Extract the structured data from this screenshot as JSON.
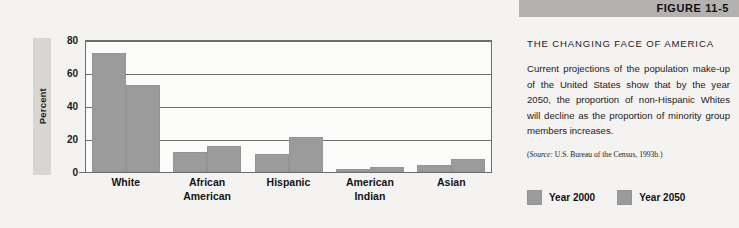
{
  "figure": {
    "number_label": "FIGURE 11-5",
    "title": "THE CHANGING FACE OF AMERICA",
    "body": "Current projections of the population make-up of the United States show that by the year 2050, the proportion of non-Hispanic Whites will decline as the proportion of minority group members increases.",
    "source_prefix": "(",
    "source_word": "Source:",
    "source_rest": " U.S. Bureau of the Census, 1993b.)"
  },
  "legend": {
    "items": [
      {
        "label": "Year 2000",
        "color": "#9b9b9b"
      },
      {
        "label": "Year 2050",
        "color": "#9b9b9b"
      }
    ]
  },
  "chart_data": {
    "type": "bar",
    "title": "THE CHANGING FACE OF AMERICA",
    "xlabel": "",
    "ylabel": "Percent",
    "ylim": [
      0,
      80
    ],
    "yticks": [
      0,
      20,
      40,
      60,
      80
    ],
    "ytick_labels": [
      "0",
      "20",
      "40",
      "60",
      "80"
    ],
    "grid": true,
    "legend_position": "bottom-right",
    "categories": [
      "White",
      "African American",
      "Hispanic",
      "American Indian",
      "Asian"
    ],
    "category_lines": [
      [
        "White"
      ],
      [
        "African",
        "American"
      ],
      [
        "Hispanic"
      ],
      [
        "American",
        "Indian"
      ],
      [
        "Asian"
      ]
    ],
    "series": [
      {
        "name": "Year 2000",
        "color": "#9b9b9b",
        "values": [
          72,
          12,
          11,
          2,
          4
        ]
      },
      {
        "name": "Year 2050",
        "color": "#9b9b9b",
        "values": [
          53,
          16,
          21,
          3,
          8
        ]
      }
    ]
  }
}
